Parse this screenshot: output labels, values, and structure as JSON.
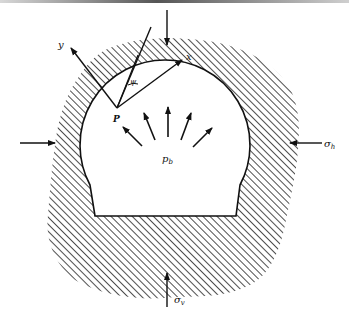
{
  "figure": {
    "labels": {
      "y_axis": "y",
      "x_axis": "x",
      "angle": "ψ",
      "point": "P",
      "internal_pressure": "p",
      "internal_pressure_sub": "b",
      "horizontal_stress": "σ",
      "horizontal_stress_sub": "h",
      "vertical_stress": "σ",
      "vertical_stress_sub": "v"
    },
    "colors": {
      "ink": "#111111",
      "background": "#ffffff",
      "hatch": "#222222"
    }
  }
}
